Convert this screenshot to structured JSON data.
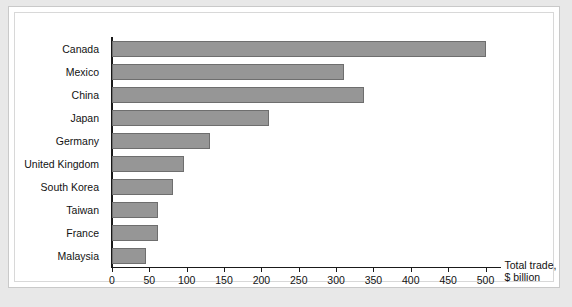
{
  "chart_data": {
    "type": "bar",
    "orientation": "horizontal",
    "title": "",
    "xlabel": "Total trade, $ billion",
    "ylabel": "",
    "categories": [
      "Canada",
      "Mexico",
      "China",
      "Japan",
      "Germany",
      "United Kingdom",
      "South Korea",
      "Taiwan",
      "France",
      "Malaysia"
    ],
    "values": [
      500,
      311,
      338,
      210,
      131,
      97,
      81,
      61,
      62,
      45
    ],
    "xlim": [
      0,
      500
    ],
    "xticks": [
      0,
      50,
      100,
      150,
      200,
      250,
      300,
      350,
      400,
      450,
      500
    ],
    "xtick_labels": [
      "0",
      "50",
      "100",
      "150",
      "200",
      "250",
      "300",
      "350",
      "400",
      "450",
      "500"
    ],
    "grid": false,
    "legend": null,
    "bar_color": "#969696",
    "bar_border_color": "#6e6e6e",
    "axis_color": "#1a1a1a"
  },
  "axis_title": {
    "line1": "Total trade,",
    "line2": "$ billion"
  }
}
